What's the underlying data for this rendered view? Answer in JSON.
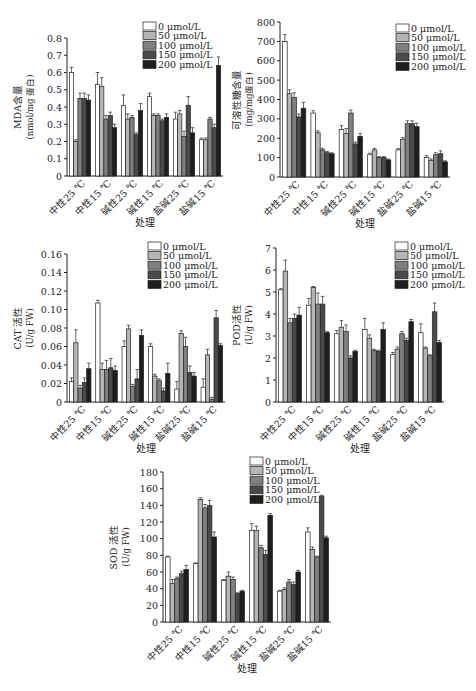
{
  "legend": [
    "0 μmol/L",
    "50 μmol/L",
    "100 μmol/L",
    "150 μmol/L",
    "200 μmol/L"
  ],
  "colors": [
    "#ffffff",
    "#b5b5b5",
    "#808080",
    "#4a4a4a",
    "#1e1e1e"
  ],
  "xlabel": "处理",
  "chart_data": [
    {
      "type": "bar",
      "id": "mda",
      "ylabel_line1": "MDA含量",
      "ylabel_line2": "(nmol/mg 蛋白)",
      "xlabel": "处理",
      "categories": [
        "中性25 ℃",
        "中性15 ℃",
        "碱性25 ℃",
        "碱性15 ℃",
        "盐碱25 ℃",
        "盐碱15 ℃"
      ],
      "ylim": [
        0,
        0.8
      ],
      "yticks": [
        "0",
        "0.1",
        "0.2",
        "0.3",
        "0.4",
        "0.5",
        "0.6",
        "0.7",
        "0.8"
      ],
      "ytick_values": [
        0,
        0.1,
        0.2,
        0.3,
        0.4,
        0.5,
        0.6,
        0.7,
        0.8
      ],
      "legend_position": "top-right",
      "series": [
        {
          "name": "0 μmol/L",
          "values": [
            0.6,
            0.53,
            0.41,
            0.46,
            0.33,
            0.21
          ],
          "errors": [
            0.03,
            0.07,
            0.06,
            0.02,
            0.04,
            0.01
          ]
        },
        {
          "name": "50 μmol/L",
          "values": [
            0.2,
            0.52,
            0.33,
            0.35,
            0.36,
            0.21
          ],
          "errors": [
            0.01,
            0.05,
            0.03,
            0.01,
            0.02,
            0.01
          ]
        },
        {
          "name": "100 μmol/L",
          "values": [
            0.45,
            0.33,
            0.34,
            0.35,
            0.23,
            0.33
          ],
          "errors": [
            0.03,
            0.02,
            0.01,
            0.01,
            0.03,
            0.01
          ]
        },
        {
          "name": "150 μmol/L",
          "values": [
            0.45,
            0.35,
            0.24,
            0.32,
            0.41,
            0.28
          ],
          "errors": [
            0.03,
            0.02,
            0.01,
            0.01,
            0.05,
            0.02
          ]
        },
        {
          "name": "200 μmol/L",
          "values": [
            0.44,
            0.28,
            0.38,
            0.34,
            0.25,
            0.64
          ],
          "errors": [
            0.03,
            0.02,
            0.04,
            0.02,
            0.03,
            0.05
          ]
        }
      ]
    },
    {
      "type": "bar",
      "id": "soluble-sugar",
      "ylabel_line1": "可溶性糖含量",
      "ylabel_line2": "(mg/mg蛋白)",
      "xlabel": "处理",
      "categories": [
        "中性25 ℃",
        "中性15 ℃",
        "碱性25 ℃",
        "碱性15 ℃",
        "盐碱25 ℃",
        "盐碱15 ℃"
      ],
      "ylim": [
        0,
        800
      ],
      "yticks": [
        "0",
        "100",
        "200",
        "300",
        "400",
        "500",
        "600",
        "700",
        "800"
      ],
      "ytick_values": [
        0,
        100,
        200,
        300,
        400,
        500,
        600,
        700,
        800
      ],
      "legend_position": "top-right",
      "series": [
        {
          "name": "0 μmol/L",
          "values": [
            700,
            330,
            245,
            115,
            140,
            100
          ],
          "errors": [
            35,
            12,
            20,
            8,
            6,
            10
          ]
        },
        {
          "name": "50 μmol/L",
          "values": [
            430,
            228,
            225,
            140,
            195,
            85
          ],
          "errors": [
            20,
            10,
            25,
            8,
            8,
            8
          ]
        },
        {
          "name": "100 μmol/L",
          "values": [
            410,
            140,
            330,
            100,
            275,
            115
          ],
          "errors": [
            25,
            8,
            15,
            5,
            15,
            10
          ]
        },
        {
          "name": "150 μmol/L",
          "values": [
            310,
            125,
            170,
            100,
            275,
            120
          ],
          "errors": [
            15,
            6,
            10,
            6,
            15,
            15
          ]
        },
        {
          "name": "200 μmol/L",
          "values": [
            355,
            120,
            210,
            88,
            260,
            78
          ],
          "errors": [
            30,
            5,
            15,
            5,
            18,
            6
          ]
        }
      ]
    },
    {
      "type": "bar",
      "id": "cat",
      "ylabel_line1": "CAT 活性",
      "ylabel_line2": "(U/g FW)",
      "xlabel": "处理",
      "categories": [
        "中性25 ℃",
        "中性15 ℃",
        "碱性25 ℃",
        "碱性15 ℃",
        "盐碱25 ℃",
        "盐碱15 ℃"
      ],
      "ylim": [
        0,
        0.16
      ],
      "yticks": [
        "0",
        "0.02",
        "0.04",
        "0.06",
        "0.08",
        "0.10",
        "0.12",
        "0.14",
        "0.16"
      ],
      "ytick_values": [
        0,
        0.02,
        0.04,
        0.06,
        0.08,
        0.1,
        0.12,
        0.14,
        0.16
      ],
      "legend_position": "top-right",
      "series": [
        {
          "name": "0 μmol/L",
          "values": [
            0.022,
            0.107,
            0.06,
            0.06,
            0.014,
            0.016
          ],
          "errors": [
            0.004,
            0.003,
            0.006,
            0.003,
            0.008,
            0.009
          ]
        },
        {
          "name": "50 μmol/L",
          "values": [
            0.064,
            0.035,
            0.079,
            0.028,
            0.074,
            0.051
          ],
          "errors": [
            0.014,
            0.007,
            0.004,
            0.002,
            0.003,
            0.006
          ]
        },
        {
          "name": "100 μmol/L",
          "values": [
            0.015,
            0.035,
            0.017,
            0.023,
            0.06,
            0.003
          ],
          "errors": [
            0.003,
            0.01,
            0.002,
            0.002,
            0.01,
            0.002
          ]
        },
        {
          "name": "150 μmol/L",
          "values": [
            0.021,
            0.037,
            0.025,
            0.012,
            0.032,
            0.091
          ],
          "errors": [
            0.005,
            0.01,
            0.01,
            0.003,
            0.007,
            0.008
          ]
        },
        {
          "name": "200 μmol/L",
          "values": [
            0.036,
            0.034,
            0.072,
            0.031,
            0.028,
            0.061
          ],
          "errors": [
            0.006,
            0.005,
            0.006,
            0.011,
            0.004,
            0.002
          ]
        }
      ]
    },
    {
      "type": "bar",
      "id": "pod",
      "ylabel_line1": "POD活性",
      "ylabel_line2": "(U/g FW)",
      "xlabel": "处理",
      "categories": [
        "中性25 ℃",
        "中性15 ℃",
        "碱性25 ℃",
        "碱性15 ℃",
        "盐碱25 ℃",
        "盐碱15 ℃"
      ],
      "ylim": [
        0,
        7
      ],
      "yticks": [
        "0",
        "1",
        "2",
        "3",
        "4",
        "5",
        "6",
        "7"
      ],
      "ytick_values": [
        0,
        1,
        2,
        3,
        4,
        5,
        6,
        7
      ],
      "legend_position": "top-right",
      "series": [
        {
          "name": "0 μmol/L",
          "values": [
            5.1,
            4.4,
            3.1,
            3.3,
            2.15,
            3.15
          ],
          "errors": [
            0.05,
            0.3,
            0.15,
            0.5,
            0.1,
            0.4
          ]
        },
        {
          "name": "50 μmol/L",
          "values": [
            5.95,
            5.2,
            3.4,
            2.9,
            2.4,
            2.45
          ],
          "errors": [
            0.5,
            0.05,
            0.3,
            0.15,
            0.1,
            0.05
          ]
        },
        {
          "name": "100 μmol/L",
          "values": [
            3.6,
            4.45,
            3.2,
            2.35,
            3.1,
            2.1
          ],
          "errors": [
            0.2,
            0.5,
            0.3,
            0.05,
            0.1,
            0.05
          ]
        },
        {
          "name": "150 μmol/L",
          "values": [
            3.8,
            4.45,
            2.0,
            2.3,
            2.8,
            4.1
          ],
          "errors": [
            0.2,
            0.35,
            0.1,
            0.05,
            0.1,
            0.4
          ]
        },
        {
          "name": "200 μmol/L",
          "values": [
            3.95,
            3.15,
            2.3,
            3.3,
            3.65,
            2.7
          ],
          "errors": [
            0.35,
            0.05,
            0.05,
            0.3,
            0.1,
            0.1
          ]
        }
      ]
    },
    {
      "type": "bar",
      "id": "sod",
      "ylabel_line1": "SOD 活性",
      "ylabel_line2": "(U/g FW)",
      "xlabel": "处理",
      "categories": [
        "中性25 ℃",
        "中性15 ℃",
        "碱性25 ℃",
        "碱性15 ℃",
        "盐碱25 ℃",
        "盐碱15 ℃"
      ],
      "ylim": [
        0,
        180
      ],
      "yticks": [
        "0",
        "20",
        "40",
        "60",
        "80",
        "100",
        "120",
        "140",
        "160",
        "180"
      ],
      "ytick_values": [
        0,
        20,
        40,
        60,
        80,
        100,
        120,
        140,
        160,
        180
      ],
      "legend_position": "top-right",
      "series": [
        {
          "name": "0 μmol/L",
          "values": [
            78,
            70,
            50,
            110,
            37,
            108
          ],
          "errors": [
            1,
            1,
            1,
            8,
            1,
            5
          ]
        },
        {
          "name": "50 μmol/L",
          "values": [
            46,
            147,
            55,
            110,
            39,
            87
          ],
          "errors": [
            5,
            2,
            5,
            5,
            2,
            3
          ]
        },
        {
          "name": "100 μmol/L",
          "values": [
            52,
            137,
            51,
            89,
            48,
            78
          ],
          "errors": [
            2,
            4,
            3,
            3,
            3,
            1
          ]
        },
        {
          "name": "150 μmol/L",
          "values": [
            58,
            140,
            34,
            81,
            45,
            151
          ],
          "errors": [
            3,
            6,
            1,
            5,
            3,
            1
          ]
        },
        {
          "name": "200 μmol/L",
          "values": [
            63,
            102,
            37,
            128,
            60,
            101
          ],
          "errors": [
            5,
            6,
            1,
            2,
            2,
            2
          ]
        }
      ]
    }
  ]
}
